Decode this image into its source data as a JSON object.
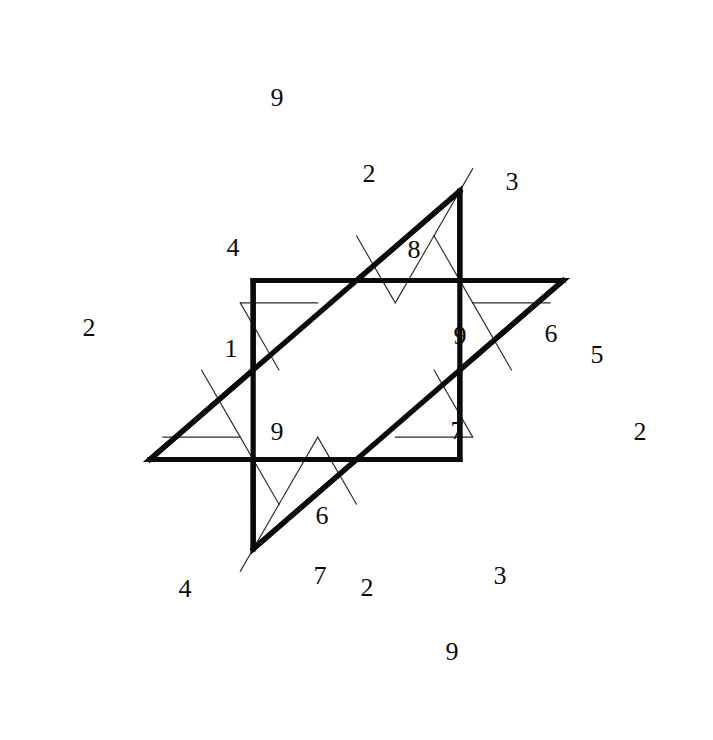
{
  "figure": {
    "shape": "hexagram",
    "background_color": "#ffffff",
    "line_color": "#2b2b2b",
    "outline_color": "#0a0a0a",
    "center": "empty hexagon",
    "unit": 77.5,
    "origin_x": 356.5,
    "origin_y": 370.0,
    "outline_stroke_width": 5.2,
    "grid_stroke_width": 1.15
  },
  "cells": [
    {
      "name": "cell-top-tip-9",
      "value": "9",
      "x": 277,
      "y": 100
    },
    {
      "name": "cell-upper-2",
      "value": "2",
      "x": 369,
      "y": 176
    },
    {
      "name": "cell-upper-right-3",
      "value": "3",
      "x": 512,
      "y": 184
    },
    {
      "name": "cell-upper-left-4",
      "value": "4",
      "x": 233,
      "y": 250
    },
    {
      "name": "cell-upper-right-8",
      "value": "8",
      "x": 414,
      "y": 252
    },
    {
      "name": "cell-left-2",
      "value": "2",
      "x": 89,
      "y": 330
    },
    {
      "name": "cell-mid-left-1",
      "value": "1",
      "x": 231,
      "y": 351
    },
    {
      "name": "cell-mid-right-9",
      "value": "9",
      "x": 460,
      "y": 338
    },
    {
      "name": "cell-right-6",
      "value": "6",
      "x": 551,
      "y": 336
    },
    {
      "name": "cell-right-5",
      "value": "5",
      "x": 597,
      "y": 357
    },
    {
      "name": "cell-lower-left-9",
      "value": "9",
      "x": 277,
      "y": 434
    },
    {
      "name": "cell-lower-right-7",
      "value": "7",
      "x": 457,
      "y": 433
    },
    {
      "name": "cell-right-bottom-2",
      "value": "2",
      "x": 640,
      "y": 434
    },
    {
      "name": "cell-lower-6",
      "value": "6",
      "x": 322,
      "y": 518
    },
    {
      "name": "cell-bottom-left-4",
      "value": "4",
      "x": 185,
      "y": 591
    },
    {
      "name": "cell-bottom-7",
      "value": "7",
      "x": 320,
      "y": 578
    },
    {
      "name": "cell-bottom-2",
      "value": "2",
      "x": 367,
      "y": 590
    },
    {
      "name": "cell-bottom-right-3",
      "value": "3",
      "x": 500,
      "y": 578
    },
    {
      "name": "cell-bottom-tip-9",
      "value": "9",
      "x": 452,
      "y": 654
    }
  ],
  "chart_data": {
    "type": "table",
    "xlabel": "",
    "ylabel": "",
    "grid": true,
    "legend": "none",
    "categories": [
      "top-tip",
      "upper",
      "upper-right",
      "upper-left",
      "upper-right-inner",
      "left",
      "mid-left",
      "mid-right",
      "right-upper",
      "right-edge",
      "lower-left",
      "lower-right",
      "right-lower",
      "lower-center",
      "bottom-left",
      "bottom-center-left",
      "bottom-center-right",
      "bottom-right",
      "bottom-tip"
    ],
    "values": [
      9,
      2,
      3,
      4,
      8,
      2,
      1,
      9,
      6,
      5,
      9,
      7,
      2,
      6,
      4,
      7,
      2,
      3,
      9
    ],
    "digits_in_reading_order": [
      "9",
      "2",
      "3",
      "4",
      "8",
      "2",
      "1",
      "9",
      "6",
      "5",
      "9",
      "7",
      "2",
      "6",
      "4",
      "7",
      "2",
      "3",
      "9"
    ],
    "digit_count": 19
  }
}
